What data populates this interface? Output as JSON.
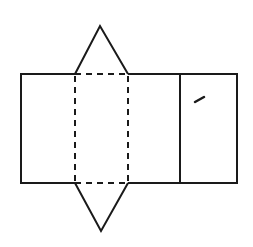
{
  "diagram": {
    "stroke_color": "#1a1a1a",
    "background": "#ffffff",
    "stroke_width": 2,
    "shapes": {
      "outer_rectangle": {
        "x": 21,
        "y": 74,
        "width": 216,
        "height": 109
      },
      "fold_line_left": {
        "x1": 75,
        "y1": 74,
        "x2": 75,
        "y2": 183,
        "style": "dashed"
      },
      "fold_line_right": {
        "x1": 128,
        "y1": 74,
        "x2": 128,
        "y2": 183,
        "style": "dashed"
      },
      "fold_line_top": {
        "x1": 75,
        "y1": 74,
        "x2": 128,
        "y2": 74,
        "style": "dashed"
      },
      "fold_line_bottom": {
        "x1": 75,
        "y1": 183,
        "x2": 128,
        "y2": 183,
        "style": "dashed"
      },
      "solid_divider": {
        "x1": 180,
        "y1": 74,
        "x2": 180,
        "y2": 183,
        "style": "solid"
      },
      "top_triangle": {
        "points": "75,74 100,26 128,74"
      },
      "bottom_triangle": {
        "points": "75,183 101,231 128,183"
      },
      "ink_mark": {
        "points": "195,102 204,97"
      }
    }
  }
}
